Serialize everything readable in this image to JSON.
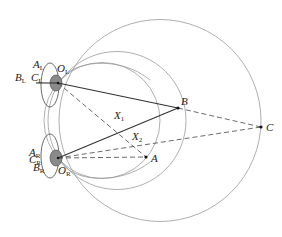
{
  "diagram": {
    "colors": {
      "circle": "#9a9a9a",
      "solid_line": "#333333",
      "dashed_line": "#444444",
      "eye_fill": "#888888",
      "point": "#111111"
    },
    "points": {
      "OL": {
        "label": "O",
        "sub": "L",
        "x": 58,
        "y": 83
      },
      "OR": {
        "label": "O",
        "sub": "R",
        "x": 58,
        "y": 158
      },
      "A": {
        "label": "A",
        "x": 146,
        "y": 157
      },
      "B": {
        "label": "B",
        "x": 178,
        "y": 108
      },
      "C": {
        "label": "C",
        "x": 261,
        "y": 127
      },
      "X1": {
        "label": "X",
        "sub": "1",
        "x": 120,
        "y": 121
      },
      "X2": {
        "label": "X",
        "sub": "2",
        "x": 133,
        "y": 135
      }
    },
    "eye_labels": {
      "left": [
        {
          "label": "A",
          "sub": "L"
        },
        {
          "label": "B",
          "sub": "L"
        },
        {
          "label": "C",
          "sub": "L"
        }
      ],
      "right": [
        {
          "label": "A",
          "sub": "R"
        },
        {
          "label": "B",
          "sub": "R"
        },
        {
          "label": "C",
          "sub": "R"
        }
      ]
    },
    "lines": {
      "solid": [
        [
          "OL",
          "B"
        ],
        [
          "OR",
          "B"
        ]
      ],
      "dashed": [
        [
          "OL",
          "A"
        ],
        [
          "OR",
          "A"
        ],
        [
          "OL",
          "C"
        ],
        [
          "OR",
          "C"
        ],
        [
          "B",
          "C"
        ]
      ]
    },
    "circles": [
      {
        "name": "circle-through-A",
        "cx": 102,
        "cy": 120.5,
        "r": 58
      },
      {
        "name": "circle-through-B",
        "cx": 117,
        "cy": 120.5,
        "r": 69
      },
      {
        "name": "circle-through-C",
        "cx": 160,
        "cy": 120.5,
        "r": 101
      }
    ]
  }
}
